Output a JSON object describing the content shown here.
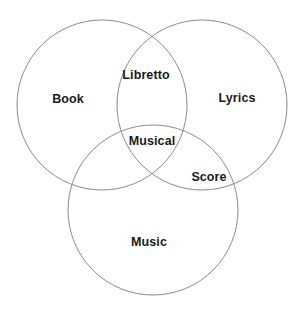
{
  "figure": {
    "type": "venn-diagram",
    "set_count": 3,
    "background_color": "#ffffff",
    "stroke_color": "#8a8a8a",
    "text_color": "#1a1a1a"
  },
  "chart_data": {
    "type": "venn",
    "title": "",
    "sets": [
      {
        "id": "book",
        "label": "Book",
        "cx": 102,
        "cy": 105,
        "r": 85
      },
      {
        "id": "lyrics",
        "label": "Lyrics",
        "cx": 202,
        "cy": 105,
        "r": 85
      },
      {
        "id": "music",
        "label": "Music",
        "cx": 153,
        "cy": 210,
        "r": 85
      }
    ],
    "regions": [
      {
        "id": "book-only",
        "label": "Book",
        "members": [
          "book"
        ]
      },
      {
        "id": "lyrics-only",
        "label": "Lyrics",
        "members": [
          "lyrics"
        ]
      },
      {
        "id": "music-only",
        "label": "Music",
        "members": [
          "music"
        ]
      },
      {
        "id": "book-lyrics",
        "label": "Libretto",
        "members": [
          "book",
          "lyrics"
        ]
      },
      {
        "id": "lyrics-music",
        "label": "Score",
        "members": [
          "lyrics",
          "music"
        ]
      },
      {
        "id": "book-lyrics-music",
        "label": "Musical",
        "members": [
          "book",
          "lyrics",
          "music"
        ]
      }
    ]
  },
  "labels": {
    "book": "Book",
    "lyrics": "Lyrics",
    "music": "Music",
    "libretto": "Libretto",
    "score": "Score",
    "musical": "Musical"
  }
}
